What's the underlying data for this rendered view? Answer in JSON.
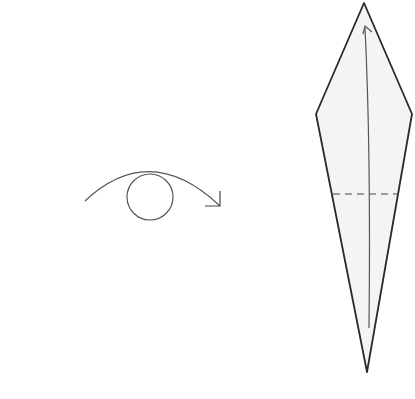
{
  "diagram": {
    "type": "origami-instruction-step",
    "colors": {
      "background": "#ffffff",
      "stroke": "#2a2a2a",
      "paper_fill": "#f4f4f4",
      "arrow_stroke": "#555555"
    },
    "elements": [
      {
        "id": "turn-over-symbol",
        "description": "circle with curved arrow indicating turn model over"
      },
      {
        "id": "kite-shape",
        "description": "folded paper diamond/kite shape"
      },
      {
        "id": "fold-arrow",
        "description": "curved arrow inside kite pointing up"
      },
      {
        "id": "valley-fold-line",
        "description": "dashed horizontal fold line"
      }
    ]
  }
}
